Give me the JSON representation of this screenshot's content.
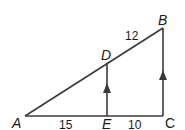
{
  "diagram": {
    "points": {
      "A": {
        "label": "A",
        "x": 25,
        "y": 116
      },
      "E": {
        "label": "E",
        "x": 107,
        "y": 116
      },
      "C": {
        "label": "C",
        "x": 163,
        "y": 116
      },
      "B": {
        "label": "B",
        "x": 163,
        "y": 28
      },
      "D": {
        "label": "D",
        "x": 107,
        "y": 63
      }
    },
    "segments": {
      "AE": "15",
      "EC": "10",
      "DB": "12"
    },
    "line_color": "#3a3a3a"
  }
}
